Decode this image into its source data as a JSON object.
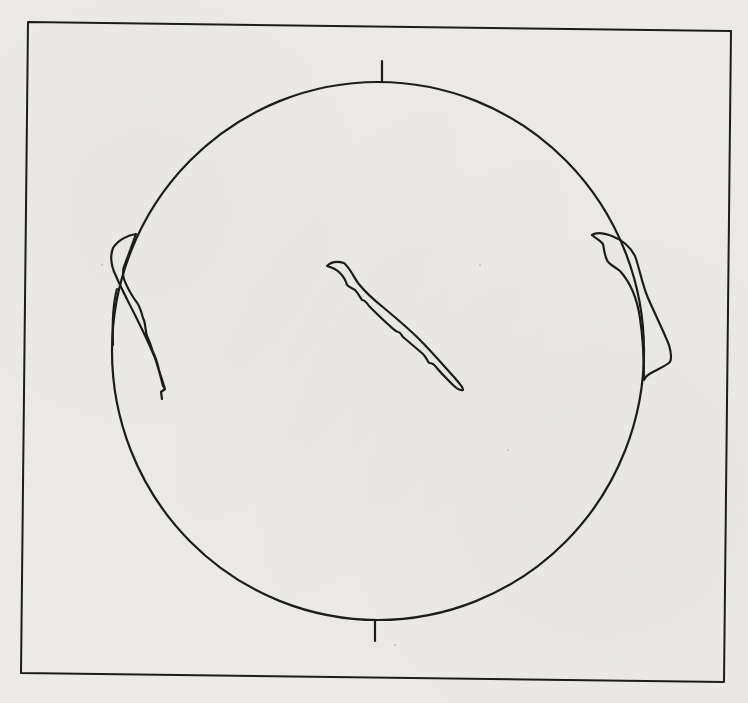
{
  "figure": {
    "colors": {
      "background": "#ecebe8",
      "line": "#1c1c1c"
    },
    "frame": {
      "top_left": [
        28,
        22
      ],
      "top_right": [
        731,
        31
      ],
      "bottom_right": [
        724,
        682
      ],
      "bottom_left": [
        21,
        673
      ]
    },
    "disk": {
      "center": [
        378,
        351
      ],
      "rx": 266,
      "ry": 269
    },
    "ticks": [
      {
        "name": "north-tick",
        "x1": 382,
        "y1": 62,
        "x2": 382,
        "y2": 82
      },
      {
        "name": "south-tick",
        "x1": 375,
        "y1": 620,
        "x2": 375,
        "y2": 641
      }
    ],
    "features": [
      {
        "name": "left-limb-prominence",
        "label": "Prominence (east limb)"
      },
      {
        "name": "disk-filament",
        "label": "Filament on disk"
      },
      {
        "name": "right-limb-prominence",
        "label": "Prominence (west limb)"
      }
    ]
  }
}
